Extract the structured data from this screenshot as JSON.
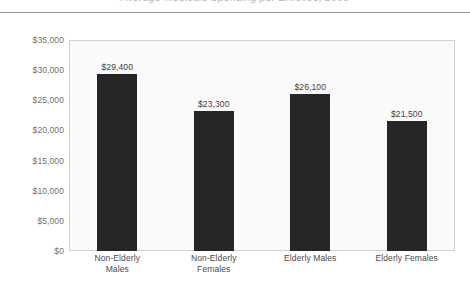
{
  "document": {
    "title_partial": "Average Medicaid Spending per Enrollee, 2009",
    "header_rule": true
  },
  "chart_data": {
    "type": "bar",
    "title": "Average Medicaid Spending per Enrollee, 2009",
    "xlabel": "",
    "ylabel": "",
    "categories": [
      "Non-Elderly Males",
      "Non-Elderly Females",
      "Elderly Males",
      "Elderly Females"
    ],
    "category_lines": [
      [
        "Non-Elderly",
        "Males"
      ],
      [
        "Non-Elderly",
        "Females"
      ],
      [
        "Elderly Males"
      ],
      [
        "Elderly Females"
      ]
    ],
    "values": [
      29400,
      23300,
      26100,
      21500
    ],
    "data_labels": [
      "$29,400",
      "$23,300",
      "$26,100",
      "$21,500"
    ],
    "ylim": [
      0,
      35000
    ],
    "ytick_step": 5000,
    "ytick_values": [
      35000,
      30000,
      25000,
      20000,
      15000,
      10000,
      5000,
      0
    ],
    "ytick_labels": [
      "$35,000",
      "$30,000",
      "$25,000",
      "$20,000",
      "$15,000",
      "$10,000",
      "$5,000",
      "$0"
    ],
    "grid": false,
    "legend": null,
    "bar_color": "#262626",
    "plot_background": "#fafafa",
    "plot_border_color": "#d2d2d2"
  }
}
